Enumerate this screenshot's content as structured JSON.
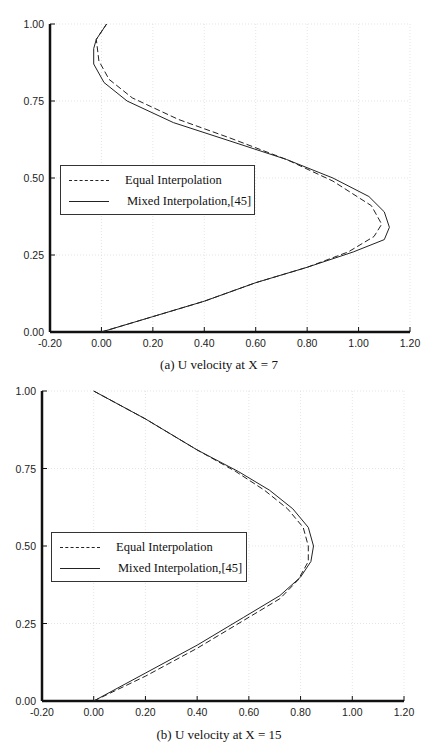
{
  "chart_data": [
    {
      "type": "line",
      "title": "(a) U velocity at X = 7",
      "xlabel": "",
      "ylabel": "",
      "xlim": [
        -0.2,
        1.2
      ],
      "ylim": [
        0.0,
        1.0
      ],
      "xticks": [
        "-0.20",
        "0.00",
        "0.20",
        "0.40",
        "0.60",
        "0.80",
        "1.00",
        "1.20"
      ],
      "yticks": [
        "0.00",
        "0.25",
        "0.50",
        "0.75",
        "1.00"
      ],
      "grid": true,
      "legend_position": "center-left",
      "series": [
        {
          "name": "Equal Interpolation",
          "style": "dashed",
          "points": [
            [
              0.0,
              0.0
            ],
            [
              0.2,
              0.05
            ],
            [
              0.4,
              0.1
            ],
            [
              0.6,
              0.16
            ],
            [
              0.8,
              0.21
            ],
            [
              0.96,
              0.26
            ],
            [
              1.06,
              0.31
            ],
            [
              1.09,
              0.35
            ],
            [
              1.05,
              0.41
            ],
            [
              0.9,
              0.49
            ],
            [
              0.72,
              0.56
            ],
            [
              0.5,
              0.63
            ],
            [
              0.3,
              0.69
            ],
            [
              0.12,
              0.76
            ],
            [
              0.03,
              0.82
            ],
            [
              -0.01,
              0.88
            ],
            [
              -0.02,
              0.95
            ],
            [
              0.02,
              1.0
            ]
          ]
        },
        {
          "name": "Mixed Interpolation,[45]",
          "style": "solid",
          "points": [
            [
              0.0,
              0.0
            ],
            [
              0.2,
              0.05
            ],
            [
              0.4,
              0.1
            ],
            [
              0.6,
              0.16
            ],
            [
              0.8,
              0.21
            ],
            [
              0.98,
              0.26
            ],
            [
              1.1,
              0.3
            ],
            [
              1.12,
              0.34
            ],
            [
              1.1,
              0.39
            ],
            [
              1.04,
              0.44
            ],
            [
              0.9,
              0.5
            ],
            [
              0.72,
              0.56
            ],
            [
              0.5,
              0.62
            ],
            [
              0.28,
              0.68
            ],
            [
              0.1,
              0.75
            ],
            [
              0.01,
              0.81
            ],
            [
              -0.03,
              0.87
            ],
            [
              -0.03,
              0.92
            ],
            [
              -0.02,
              0.95
            ],
            [
              0.02,
              1.0
            ]
          ]
        }
      ]
    },
    {
      "type": "line",
      "title": "(b) U velocity at X = 15",
      "xlabel": "",
      "ylabel": "",
      "xlim": [
        -0.2,
        1.2
      ],
      "ylim": [
        0.0,
        1.0
      ],
      "xticks": [
        "-0.20",
        "0.00",
        "0.20",
        "0.40",
        "0.60",
        "0.80",
        "1.00",
        "1.20"
      ],
      "yticks": [
        "0.00",
        "0.25",
        "0.50",
        "0.75",
        "1.00"
      ],
      "grid": true,
      "legend_position": "center-left",
      "series": [
        {
          "name": "Equal Interpolation",
          "style": "dashed",
          "points": [
            [
              0.0,
              0.0
            ],
            [
              0.2,
              0.08
            ],
            [
              0.4,
              0.17
            ],
            [
              0.58,
              0.26
            ],
            [
              0.72,
              0.33
            ],
            [
              0.79,
              0.39
            ],
            [
              0.83,
              0.45
            ],
            [
              0.83,
              0.5
            ],
            [
              0.81,
              0.56
            ],
            [
              0.75,
              0.62
            ],
            [
              0.66,
              0.68
            ],
            [
              0.55,
              0.74
            ],
            [
              0.4,
              0.81
            ],
            [
              0.2,
              0.91
            ],
            [
              0.0,
              1.0
            ]
          ]
        },
        {
          "name": "Mixed Interpolation,[45]",
          "style": "solid",
          "points": [
            [
              0.0,
              0.0
            ],
            [
              0.2,
              0.09
            ],
            [
              0.4,
              0.18
            ],
            [
              0.58,
              0.27
            ],
            [
              0.72,
              0.34
            ],
            [
              0.8,
              0.4
            ],
            [
              0.84,
              0.45
            ],
            [
              0.85,
              0.5
            ],
            [
              0.83,
              0.56
            ],
            [
              0.77,
              0.62
            ],
            [
              0.68,
              0.68
            ],
            [
              0.56,
              0.74
            ],
            [
              0.4,
              0.81
            ],
            [
              0.2,
              0.91
            ],
            [
              0.0,
              1.0
            ]
          ]
        }
      ]
    }
  ],
  "charts": [
    {
      "caption": "(a) U velocity at X = 7",
      "legend": {
        "items": [
          {
            "label": "Equal Interpolation"
          },
          {
            "label": "Mixed Interpolation,[45]"
          }
        ]
      }
    },
    {
      "caption": "(b) U velocity at X = 15",
      "legend": {
        "items": [
          {
            "label": "Equal Interpolation"
          },
          {
            "label": "Mixed Interpolation,[45]"
          }
        ]
      }
    }
  ]
}
